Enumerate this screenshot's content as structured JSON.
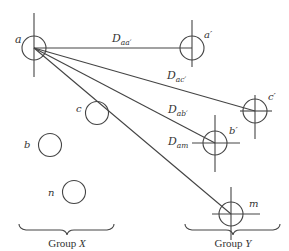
{
  "diagram": {
    "type": "distance diagram between two groups of elements",
    "group_x": {
      "label_prefix": "Group ",
      "label_var": "X",
      "members": [
        {
          "id": "a",
          "label": "a",
          "cx": 34,
          "cy": 48,
          "marked": "vertical-line"
        },
        {
          "id": "c",
          "label": "c",
          "cx": 97,
          "cy": 113
        },
        {
          "id": "b",
          "label": "b",
          "cx": 50,
          "cy": 145
        },
        {
          "id": "n",
          "label": "n",
          "cx": 74,
          "cy": 192
        }
      ]
    },
    "group_y": {
      "label_prefix": "Group ",
      "label_var": "Y",
      "members": [
        {
          "id": "a_prime",
          "label": "a′",
          "cx": 192,
          "cy": 48
        },
        {
          "id": "c_prime",
          "label": "c′",
          "cx": 255,
          "cy": 111
        },
        {
          "id": "b_prime",
          "label": "b′",
          "cx": 215,
          "cy": 143
        },
        {
          "id": "m",
          "label": "m",
          "cx": 231,
          "cy": 214
        }
      ]
    },
    "distances": [
      {
        "main": "D",
        "sub": "aa′",
        "from": "a",
        "to": "a′"
      },
      {
        "main": "D",
        "sub": "ac′",
        "from": "a",
        "to": "c′"
      },
      {
        "main": "D",
        "sub": "ab′",
        "from": "a",
        "to": "b′"
      },
      {
        "main": "D",
        "sub": "am",
        "from": "a",
        "to": "m"
      }
    ]
  }
}
